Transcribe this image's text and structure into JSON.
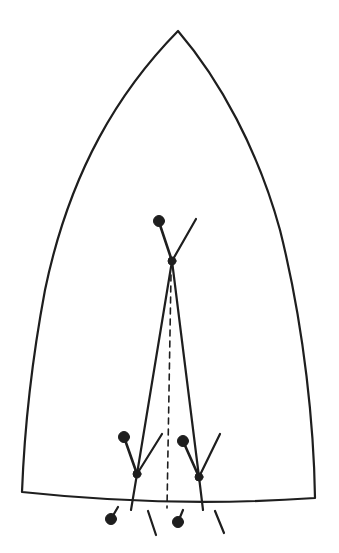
{
  "diagram": {
    "colors": {
      "stroke": "#1e1e1e",
      "background": "#ffffff"
    }
  }
}
